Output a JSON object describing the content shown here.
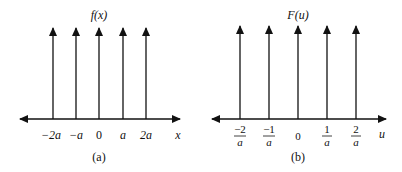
{
  "panels": [
    {
      "id": "a",
      "function_label": "f(x)",
      "function_name": "f",
      "function_arg": "x",
      "axis_label": "x",
      "tick_labels": [
        "−2a",
        "−a",
        "0",
        "a",
        "2a"
      ],
      "caption": "(a)"
    },
    {
      "id": "b",
      "function_label": "F(u)",
      "function_name": "F",
      "function_arg": "u",
      "axis_label": "u",
      "tick_labels": [
        {
          "num": "−2",
          "den": "a"
        },
        {
          "num": "−1",
          "den": "a"
        },
        {
          "plain": "0"
        },
        {
          "num": "1",
          "den": "a"
        },
        {
          "num": "2",
          "den": "a"
        }
      ],
      "caption": "(b)"
    }
  ],
  "colors": {
    "line": "#111111",
    "background": "#ffffff"
  }
}
